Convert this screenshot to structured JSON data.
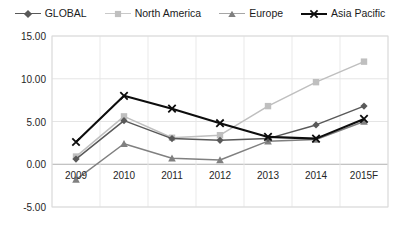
{
  "chart_data": {
    "type": "line",
    "title": "",
    "subtitle": "",
    "xlabel": "",
    "ylabel": "",
    "categories": [
      "2009",
      "2010",
      "2011",
      "2012",
      "2013",
      "2014",
      "2015F"
    ],
    "ylim": [
      -5.0,
      15.0
    ],
    "yticks": [
      15.0,
      10.0,
      5.0,
      0.0,
      -5.0
    ],
    "ytick_labels": [
      "15.00",
      "10.00",
      "5.00",
      "0.00",
      "-5.00"
    ],
    "grid": "horizontal-and-vertical-light",
    "legend_position": "top-center",
    "series": [
      {
        "name": "GLOBAL",
        "color": "#595959",
        "marker": "diamond",
        "values": [
          0.6,
          5.1,
          3.0,
          2.8,
          3.0,
          4.6,
          6.8
        ]
      },
      {
        "name": "North America",
        "color": "#bfbfbf",
        "marker": "square",
        "values": [
          0.9,
          5.6,
          3.1,
          3.4,
          6.8,
          9.6,
          12.0
        ]
      },
      {
        "name": "Europe",
        "color": "#808080",
        "marker": "triangle",
        "values": [
          -1.8,
          2.4,
          0.7,
          0.5,
          2.7,
          2.9,
          5.0
        ]
      },
      {
        "name": "Asia Pacific",
        "color": "#0d0d0d",
        "marker": "x",
        "values": [
          2.6,
          8.0,
          6.5,
          4.8,
          3.2,
          3.0,
          5.3
        ]
      }
    ]
  },
  "legend": {
    "items": [
      {
        "label": "GLOBAL"
      },
      {
        "label": "North America"
      },
      {
        "label": "Europe"
      },
      {
        "label": "Asia Pacific"
      }
    ]
  },
  "axes": {
    "y_axis_name": "value-axis",
    "x_axis_name": "category-axis"
  }
}
